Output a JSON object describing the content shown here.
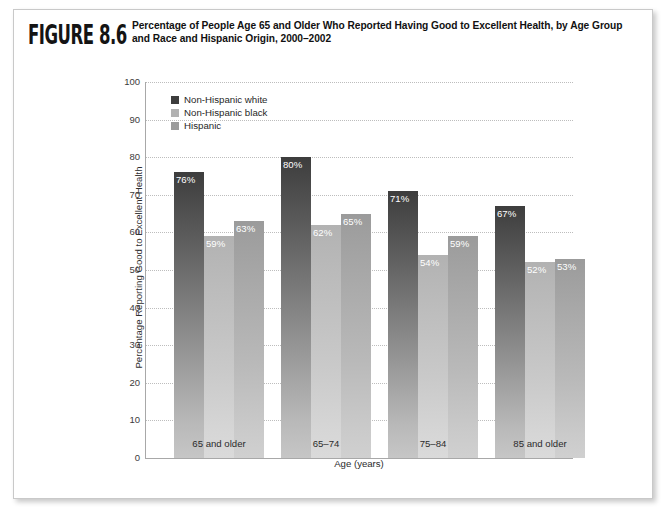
{
  "figure": {
    "number_label": "FIGURE 8.6",
    "title": "Percentage of People Age 65 and Older Who Reported Having Good to Excellent Health, by Age Group and Race and Hispanic Origin, 2000–2002"
  },
  "chart_data": {
    "type": "bar",
    "title": "Percentage of People Age 65 and Older Who Reported Having Good to Excellent Health, by Age Group and Race and Hispanic Origin, 2000–2002",
    "xlabel": "Age (years)",
    "ylabel": "Percentage Reporting Good to Excellent Health",
    "categories": [
      "65 and older",
      "65–74",
      "75–84",
      "85 and older"
    ],
    "series": [
      {
        "name": "Non-Hispanic white",
        "color": "#3d3d3d",
        "values": [
          76,
          80,
          71,
          67
        ],
        "labels": [
          "76%",
          "80%",
          "71%",
          "67%"
        ]
      },
      {
        "name": "Non-Hispanic black",
        "color": "#b2b2b2",
        "values": [
          59,
          62,
          54,
          52
        ],
        "labels": [
          "59%",
          "62%",
          "54%",
          "52%"
        ]
      },
      {
        "name": "Hispanic",
        "color": "#9b9b9b",
        "values": [
          63,
          65,
          59,
          53
        ],
        "labels": [
          "63%",
          "65%",
          "59%",
          "53%"
        ]
      }
    ],
    "ylim": [
      0,
      100
    ],
    "yticks": [
      0,
      10,
      20,
      30,
      40,
      50,
      60,
      70,
      80,
      90,
      100
    ],
    "ytick_labels": [
      "0",
      "10",
      "20",
      "30",
      "40",
      "50",
      "60",
      "70",
      "80",
      "90",
      "100"
    ],
    "grid": "horizontal-dotted",
    "legend_position": "top-left-inside"
  }
}
